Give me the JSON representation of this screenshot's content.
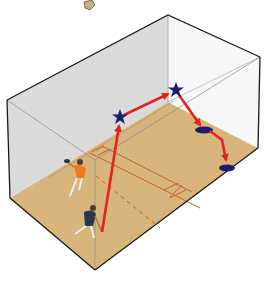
{
  "diagram": {
    "colors": {
      "floor": "#d8b67c",
      "left_wall": "#d9d9d9",
      "back_wall": "#e2e2e2",
      "right_wall": "#ffffff",
      "edge": "#1a1a1a",
      "court_lines": "#c0622a",
      "arrow": "#e0261c",
      "marker": "#1c1c6e",
      "player_orange": "#f07a20",
      "player_navy": "#2a3552"
    },
    "shot_path": [
      {
        "label": "hit",
        "type": "racket",
        "x": 102,
        "y": 232
      },
      {
        "label": "wall-1",
        "type": "star",
        "x": 120,
        "y": 117
      },
      {
        "label": "wall-2",
        "type": "star",
        "x": 176,
        "y": 90
      },
      {
        "label": "bounce-1",
        "type": "ellipse",
        "x": 204,
        "y": 130
      },
      {
        "label": "bounce-2",
        "type": "ellipse",
        "x": 227,
        "y": 168
      }
    ],
    "players": [
      {
        "label": "orange player",
        "x": 78,
        "y": 176
      },
      {
        "label": "navy player",
        "x": 84,
        "y": 218
      }
    ]
  }
}
